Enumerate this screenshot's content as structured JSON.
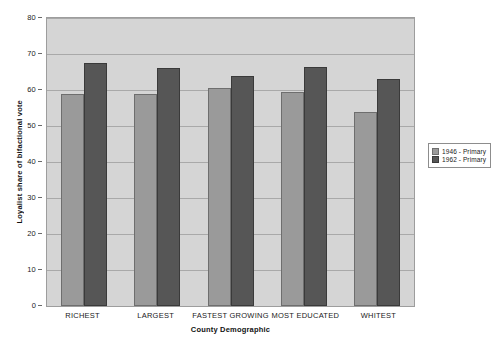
{
  "chart_data": {
    "type": "bar",
    "title": "",
    "subtitle": "",
    "xlabel": "County Demographic",
    "ylabel": "Loyalist share of bifactional vote",
    "categories": [
      "RICHEST",
      "LARGEST",
      "FASTEST GROWING",
      "MOST EDUCATED",
      "WHITEST"
    ],
    "series": [
      {
        "name": "1946 - Primary",
        "color": "#9a9a9a",
        "values": [
          59,
          59,
          60.5,
          59.5,
          54
        ]
      },
      {
        "name": "1962 - Primary",
        "color": "#565656",
        "values": [
          67.5,
          66,
          64,
          66.5,
          63
        ]
      }
    ],
    "ylim": [
      0,
      80
    ],
    "ytick_step": 10,
    "yticks": [
      0,
      10,
      20,
      30,
      40,
      50,
      60,
      70,
      80
    ],
    "ytick_labels": [
      "0",
      "10",
      "20",
      "30",
      "40",
      "50",
      "60",
      "70",
      "80"
    ],
    "grid": true,
    "grid_axis": "y",
    "legend_position": "right",
    "plot_background": "#d5d5d5",
    "figure_background": "#ffffff"
  },
  "legend": {
    "entries": [
      {
        "label": "1946 - Primary"
      },
      {
        "label": "1962 - Primary"
      }
    ]
  }
}
